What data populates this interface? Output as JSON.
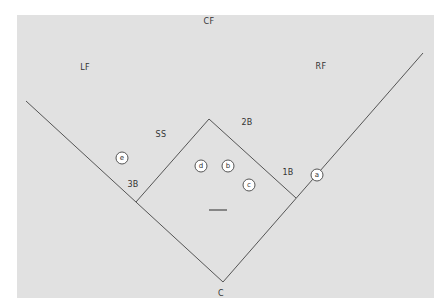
{
  "diagram": {
    "type": "baseball-field-positions",
    "colors": {
      "field": "#e1e1e1",
      "lines": "#555555",
      "text": "#333333",
      "player_fill": "#ffffff"
    },
    "position_labels": [
      {
        "id": "cf",
        "text": "CF",
        "x": 209,
        "y": 21
      },
      {
        "id": "lf",
        "text": "LF",
        "x": 85,
        "y": 67
      },
      {
        "id": "rf",
        "text": "RF",
        "x": 321,
        "y": 66
      },
      {
        "id": "ss",
        "text": "SS",
        "x": 161,
        "y": 134
      },
      {
        "id": "2b",
        "text": "2B",
        "x": 247,
        "y": 122
      },
      {
        "id": "1b",
        "text": "1B",
        "x": 288,
        "y": 172
      },
      {
        "id": "3b",
        "text": "3B",
        "x": 133,
        "y": 184
      },
      {
        "id": "c",
        "text": "C",
        "x": 221,
        "y": 293
      }
    ],
    "players": [
      {
        "id": "a",
        "text": "a",
        "x": 317,
        "y": 175
      },
      {
        "id": "b",
        "text": "b",
        "x": 228,
        "y": 166
      },
      {
        "id": "c",
        "text": "c",
        "x": 249,
        "y": 185
      },
      {
        "id": "d",
        "text": "d",
        "x": 201,
        "y": 166
      },
      {
        "id": "e",
        "text": "e",
        "x": 122,
        "y": 158
      }
    ],
    "geometry": {
      "home": [
        223,
        282
      ],
      "first": [
        296,
        198
      ],
      "second": [
        209,
        119
      ],
      "third": [
        136,
        202
      ],
      "left_foul_end": [
        26,
        101
      ],
      "right_foul_end": [
        423,
        53
      ],
      "rubber": [
        [
          209,
          210
        ],
        [
          227,
          210
        ]
      ]
    }
  }
}
